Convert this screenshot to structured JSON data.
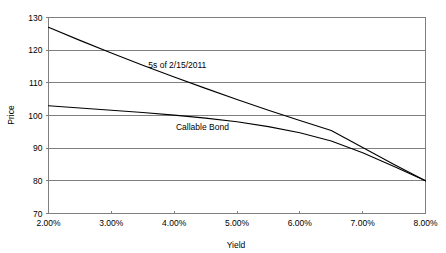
{
  "chart_data": {
    "type": "line",
    "title": "",
    "xlabel": "Yield",
    "ylabel": "Price",
    "xlim": [
      2.0,
      8.0
    ],
    "ylim": [
      70,
      130
    ],
    "grid": true,
    "legend_position": "inline-annotations",
    "x_tick_labels": [
      "2.00%",
      "3.00%",
      "4.00%",
      "5.00%",
      "6.00%",
      "7.00%",
      "8.00%"
    ],
    "x_tick_values": [
      2.0,
      3.0,
      4.0,
      5.0,
      6.0,
      7.0,
      8.0
    ],
    "y_tick_labels": [
      "70",
      "80",
      "90",
      "100",
      "110",
      "120",
      "130"
    ],
    "y_tick_values": [
      70,
      80,
      90,
      100,
      110,
      120,
      130
    ],
    "x": [
      2.0,
      2.5,
      3.0,
      3.5,
      4.0,
      4.5,
      5.0,
      5.5,
      6.0,
      6.5,
      7.0,
      7.5,
      8.0
    ],
    "series": [
      {
        "name": "5s of 2/15/2011",
        "label": "5s of 2/15/2011",
        "label_x": 4.05,
        "label_y": 114.4,
        "color": "#000000",
        "values": [
          127.0,
          123.0,
          119.1,
          115.4,
          111.8,
          108.3,
          104.9,
          101.6,
          98.5,
          95.4,
          90.2,
          85.0,
          80.0
        ]
      },
      {
        "name": "Callable Bond",
        "label": "Callable Bond",
        "label_x": 4.45,
        "label_y": 95.6,
        "color": "#000000",
        "values": [
          103.0,
          102.3,
          101.6,
          100.9,
          100.1,
          99.2,
          98.1,
          96.6,
          94.7,
          92.2,
          88.6,
          84.4,
          80.0
        ]
      }
    ],
    "annotations": [
      {
        "text": "5s of 2/15/2011",
        "x": 4.05,
        "y": 114.4
      },
      {
        "text": "Callable Bond",
        "x": 4.45,
        "y": 95.6
      }
    ],
    "colors": {
      "background": "#ffffff",
      "plot_background": "#ffffff",
      "gridline": "#7f7f7f",
      "axis": "#7f7f7f",
      "series": "#000000",
      "text": "#000000"
    }
  }
}
